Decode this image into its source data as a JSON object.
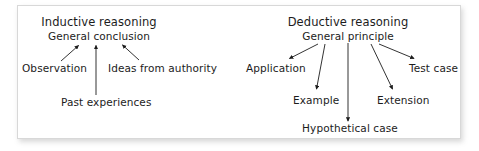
{
  "figure": {
    "background_color": "#ffffff",
    "card_color": "#ffffff",
    "border_color": "#d8d8d8",
    "text_color": "#1c1c1c",
    "arrow_color": "#1c1c1c"
  },
  "diagrams": [
    {
      "id": "inductive",
      "title": "Inductive reasoning",
      "root": "General conclusion",
      "direction": "upward",
      "supports": [
        "Observation",
        "Past experiences",
        "Ideas from authority"
      ]
    },
    {
      "id": "deductive",
      "title": "Deductive reasoning",
      "root": "General principle",
      "direction": "downward",
      "outcomes": [
        "Application",
        "Example",
        "Hypothetical case",
        "Extension",
        "Test case"
      ]
    }
  ],
  "labels": {
    "inductive_title": "Inductive reasoning",
    "inductive_root": "General conclusion",
    "observation": "Observation",
    "past_experiences": "Past experiences",
    "ideas_from_authority": "Ideas from authority",
    "deductive_title": "Deductive reasoning",
    "deductive_root": "General principle",
    "application": "Application",
    "example": "Example",
    "hypothetical_case": "Hypothetical case",
    "extension": "Extension",
    "test_case": "Test case"
  }
}
